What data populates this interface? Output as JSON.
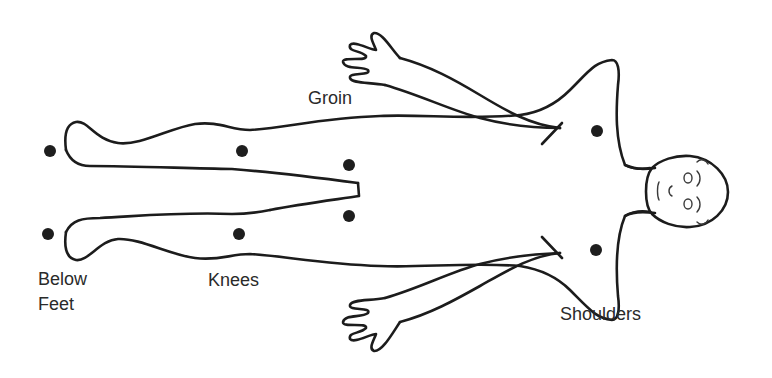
{
  "diagram": {
    "labels": {
      "groin": "Groin",
      "below_feet_line1": "Below",
      "below_feet_line2": "Feet",
      "knees": "Knees",
      "shoulders": "Shoulders"
    },
    "marker_color": "#1e1e1e",
    "line_color": "#1c1c1c",
    "markers": [
      {
        "name": "below-feet-upper",
        "x": 50,
        "y": 151
      },
      {
        "name": "below-feet-lower",
        "x": 48,
        "y": 234
      },
      {
        "name": "knee-upper",
        "x": 242,
        "y": 151
      },
      {
        "name": "knee-lower",
        "x": 239,
        "y": 234
      },
      {
        "name": "groin-upper",
        "x": 349,
        "y": 165
      },
      {
        "name": "groin-lower",
        "x": 349,
        "y": 216
      },
      {
        "name": "shoulder-upper",
        "x": 597,
        "y": 131
      },
      {
        "name": "shoulder-lower",
        "x": 596,
        "y": 250
      }
    ]
  }
}
